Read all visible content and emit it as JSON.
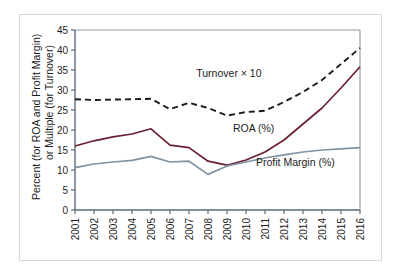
{
  "chart_data": {
    "type": "line",
    "title": "",
    "subtitle": "",
    "xlabel": "",
    "ylabel": "Percent (for ROA and Profit Margin) or Multiple (for Turnover)",
    "ylabel_line1": "Percent (for ROA and Profit Margin)",
    "ylabel_line2": "or Multiple (for Turnover)",
    "categories": [
      "2001",
      "2002",
      "2003",
      "2004",
      "2005",
      "2006",
      "2007",
      "2008",
      "2009",
      "2010",
      "2011",
      "2012",
      "2013",
      "2014",
      "2015",
      "2016"
    ],
    "x": [
      2001,
      2002,
      2003,
      2004,
      2005,
      2006,
      2007,
      2008,
      2009,
      2010,
      2011,
      2012,
      2013,
      2014,
      2015,
      2016
    ],
    "ylim": [
      0,
      45
    ],
    "xlim": [
      2001,
      2016
    ],
    "yticks": [
      0,
      5,
      10,
      15,
      20,
      25,
      30,
      35,
      40,
      45
    ],
    "ytick_labels": [
      "0",
      "5",
      "10",
      "15",
      "20",
      "25",
      "30",
      "35",
      "40",
      "45"
    ],
    "xtick_labels": [
      "2001",
      "2002",
      "2003",
      "2004",
      "2005",
      "2006",
      "2007",
      "2008",
      "2009",
      "2010",
      "2011",
      "2012",
      "2013",
      "2014",
      "2015",
      "2016"
    ],
    "grid": false,
    "legend_position": "inline-annotations",
    "series": [
      {
        "name": "Turnover × 10",
        "style": "dashed",
        "color": "#1a1a1a",
        "label_text": "Turnover × 10",
        "values": [
          27.7,
          27.5,
          27.6,
          27.7,
          27.8,
          25.2,
          26.8,
          25.5,
          23.6,
          24.5,
          24.8,
          27.0,
          29.5,
          32.5,
          36.5,
          40.5
        ]
      },
      {
        "name": "ROA (%)",
        "style": "solid",
        "color": "#6b2030",
        "label_text": "ROA (%)",
        "values": [
          16.0,
          17.3,
          18.3,
          19.0,
          20.3,
          16.2,
          15.6,
          12.2,
          11.2,
          12.5,
          14.5,
          17.5,
          21.5,
          25.5,
          30.5,
          35.8
        ]
      },
      {
        "name": "Profit Margin (%)",
        "style": "solid",
        "color": "#7f93a3",
        "label_text": "Profit Margin (%)",
        "values": [
          10.6,
          11.5,
          12.0,
          12.4,
          13.4,
          12.0,
          12.2,
          8.9,
          11.0,
          12.0,
          13.0,
          13.8,
          14.5,
          15.0,
          15.3,
          15.6
        ]
      }
    ],
    "annotations": [
      {
        "text": "Turnover × 10",
        "x": 2009.1,
        "y": 33.2
      },
      {
        "text": "ROA (%)",
        "x": 2010.4,
        "y": 19.4
      },
      {
        "text": "Profit Margin (%)",
        "x": 2012.6,
        "y": 11.0
      }
    ],
    "colors": {
      "axis": "#5a6b7a",
      "turnover": "#1a1a1a",
      "roa": "#6b2030",
      "profit_margin": "#7f93a3",
      "frame": "#d3d9df",
      "background": "#ffffff",
      "text": "#1c1c22"
    }
  }
}
